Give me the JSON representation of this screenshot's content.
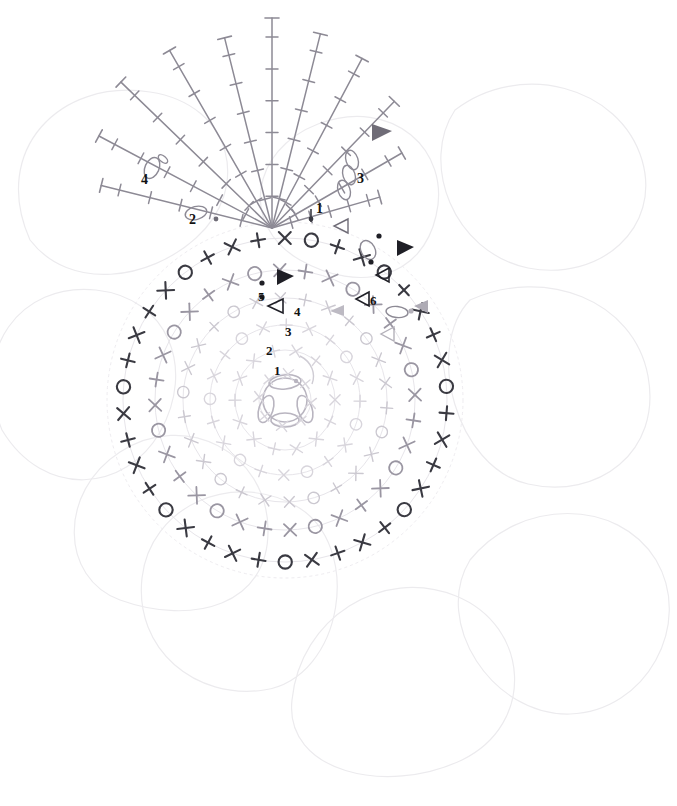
{
  "diagram": {
    "type": "crochet-stitch-chart",
    "background": "#ffffff"
  },
  "colors": {
    "petal_outline": "#eceaee",
    "round_1_3": "#d8d5dc",
    "round_4": "#cbc8d0",
    "round_5": "#9a96a2",
    "round_6": "#3a3a42",
    "fan": "#8d8a95",
    "marker_start": "#2b2b33",
    "marker_end": "#2b2b33",
    "label": "#111111"
  },
  "round_labels": [
    {
      "id": "round-1",
      "text": "1",
      "x": 274,
      "y": 375
    },
    {
      "id": "round-2",
      "text": "2",
      "x": 266,
      "y": 355
    },
    {
      "id": "round-3",
      "text": "3",
      "x": 285,
      "y": 336
    },
    {
      "id": "round-4",
      "text": "4",
      "x": 294,
      "y": 316
    },
    {
      "id": "round-5",
      "text": "5",
      "x": 258,
      "y": 301
    },
    {
      "id": "round-6",
      "text": "6",
      "x": 370,
      "y": 305
    }
  ],
  "petal_labels": [
    {
      "id": "petal-label-2",
      "text": "2",
      "x": 189,
      "y": 224
    },
    {
      "id": "petal-label-3",
      "text": "3",
      "x": 357,
      "y": 183
    },
    {
      "id": "petal-label-4",
      "text": "4",
      "x": 141,
      "y": 184
    },
    {
      "id": "petal-label-1",
      "text": "1",
      "x": 316,
      "y": 213
    }
  ],
  "stitch_legend": [
    {
      "symbol": "o",
      "name": "chain",
      "glyph": "oval"
    },
    {
      "symbol": "+",
      "name": "single-crochet",
      "glyph": "plus"
    },
    {
      "symbol": "x",
      "name": "single-crochet-alt",
      "glyph": "cross"
    },
    {
      "symbol": "O",
      "name": "chain-loop",
      "glyph": "circle"
    },
    {
      "symbol": "T",
      "name": "treble-crochet",
      "glyph": "bar-stem"
    },
    {
      "symbol": "▶",
      "name": "round-start-marker",
      "glyph": "filled-triangle"
    },
    {
      "symbol": "▷",
      "name": "round-end-marker",
      "glyph": "open-triangle"
    }
  ],
  "chart_data": {
    "type": "diagram",
    "center": {
      "x": 285,
      "y": 400
    },
    "rounds": [
      {
        "round": 1,
        "radius": 26,
        "stitch_count": 8,
        "color_key": "round_1_3",
        "pattern": [
          "x",
          "+"
        ]
      },
      {
        "round": 2,
        "radius": 50,
        "stitch_count": 14,
        "color_key": "round_1_3",
        "pattern": [
          "x",
          "+",
          "x"
        ]
      },
      {
        "round": 3,
        "radius": 75,
        "stitch_count": 20,
        "color_key": "round_1_3",
        "pattern": [
          "x",
          "+",
          "O"
        ]
      },
      {
        "round": 4,
        "radius": 102,
        "stitch_count": 26,
        "color_key": "round_4",
        "pattern": [
          "x",
          "+",
          "O",
          "x"
        ]
      },
      {
        "round": 5,
        "radius": 130,
        "stitch_count": 32,
        "color_key": "round_5",
        "pattern": [
          "O",
          "x",
          "+",
          "x"
        ]
      },
      {
        "round": 6,
        "radius": 162,
        "stitch_count": 38,
        "color_key": "round_6",
        "pattern": [
          "O",
          "+",
          "x",
          "+",
          "x"
        ]
      }
    ],
    "petal_fan": {
      "apex": {
        "x": 272,
        "y": 228
      },
      "spokes": 9,
      "stitch_type": "treble-crochet",
      "color_key": "fan"
    },
    "background_petals": 8
  }
}
